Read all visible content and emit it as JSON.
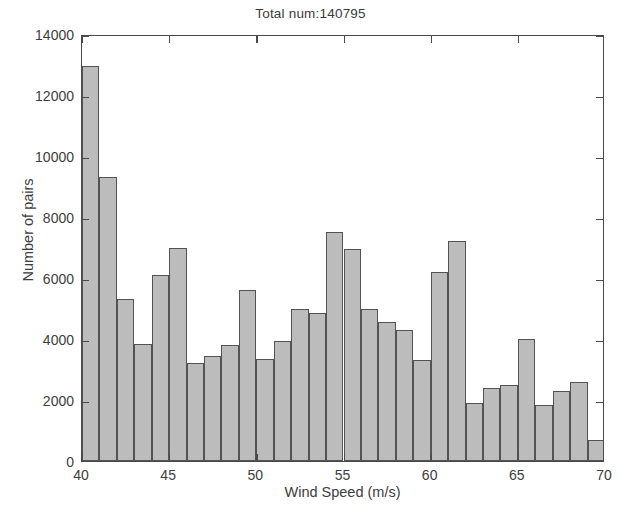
{
  "chart_data": {
    "type": "bar",
    "title": "Total num:140795",
    "subtitle": "",
    "xlabel": "Wind Speed (m/s)",
    "ylabel": "Number of pairs",
    "xlim": [
      40,
      70
    ],
    "ylim": [
      0,
      14000
    ],
    "xticks": [
      40,
      45,
      50,
      55,
      60,
      65,
      70
    ],
    "xtick_labels": [
      "40",
      "45",
      "50",
      "55",
      "60",
      "65",
      "70"
    ],
    "yticks": [
      0,
      2000,
      4000,
      6000,
      8000,
      10000,
      12000,
      14000
    ],
    "ytick_labels": [
      "0",
      "2000",
      "4000",
      "6000",
      "8000",
      "10000",
      "12000",
      "14000"
    ],
    "grid": false,
    "legend": null,
    "bin_width": 1,
    "bar_color": "#bcbcbc",
    "bar_edge_color": "#535353",
    "bin_edges": [
      40,
      41,
      42,
      43,
      44,
      45,
      46,
      47,
      48,
      49,
      50,
      51,
      52,
      53,
      54,
      55,
      56,
      57,
      58,
      59,
      60,
      61,
      62,
      63,
      64,
      65,
      66,
      67,
      68,
      69,
      70
    ],
    "categories": [
      "40-41",
      "41-42",
      "42-43",
      "43-44",
      "44-45",
      "45-46",
      "46-47",
      "47-48",
      "48-49",
      "49-50",
      "50-51",
      "51-52",
      "52-53",
      "53-54",
      "54-55",
      "55-56",
      "56-57",
      "57-58",
      "58-59",
      "59-60",
      "60-61",
      "61-62",
      "62-63",
      "63-64",
      "64-65",
      "65-66",
      "66-67",
      "67-68",
      "68-69",
      "69-70"
    ],
    "values": [
      12950,
      9300,
      5300,
      3850,
      6100,
      7000,
      3200,
      3450,
      3800,
      5600,
      3350,
      3950,
      5000,
      4850,
      7500,
      6950,
      5000,
      4550,
      4300,
      3300,
      6200,
      7200,
      1900,
      2400,
      2500,
      4000,
      1850,
      2300,
      2600,
      700
    ],
    "total_num": 140795
  },
  "figure": {
    "background_color": "#ffffff",
    "axis_color": "#4a4a4a",
    "text_color": "#3d3d3d"
  }
}
